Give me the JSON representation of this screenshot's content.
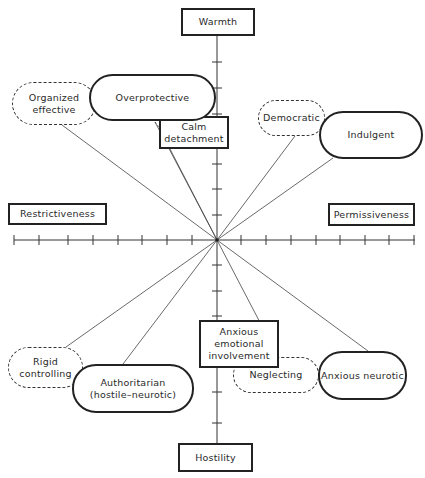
{
  "diagram": {
    "center": {
      "x": 217,
      "y": 240
    },
    "axes": {
      "vertical": {
        "top_label": "Warmth",
        "bottom_label": "Hostility"
      },
      "horizontal": {
        "left_label": "Restrictiveness",
        "right_label": "Permissiveness"
      }
    },
    "nodes": {
      "warmth": "Warmth",
      "hostility": "Hostility",
      "restrictiveness": "Restrictiveness",
      "permissiveness": "Permissiveness",
      "overprotective": "Overprotective",
      "organized_effective": "Organized\neffective",
      "calm_detachment": "Calm\ndetachment",
      "democratic": "Democratic",
      "indulgent": "Indulgent",
      "rigid_controlling": "Rigid\ncontrolling",
      "authoritarian": "Authoritarian\n(hostile–neurotic)",
      "anxious_emotional_involvement": "Anxious\nemotional\ninvolvement",
      "neglecting": "Neglecting",
      "anxious_neurotic": "Anxious neurotic"
    },
    "legend": {
      "solid_pill": "primary parental type",
      "dashed_pill": "intermediate type",
      "rectangle": "dimension / factor"
    },
    "colors": {
      "ink": "#222222",
      "background": "#ffffff"
    }
  }
}
